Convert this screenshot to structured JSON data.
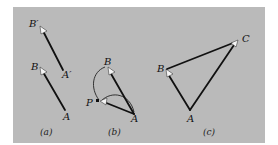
{
  "figure": {
    "background_color": "#bababa",
    "panels": [
      {
        "id": "a",
        "caption": "(a)",
        "points": {
          "B_prime": {
            "label": "B′",
            "x": 41,
            "y": 28
          },
          "A_prime": {
            "label": "A′",
            "x": 63,
            "y": 70
          },
          "B": {
            "label": "B",
            "x": 41,
            "y": 69
          },
          "A": {
            "label": "A",
            "x": 65,
            "y": 110
          }
        },
        "vectors": [
          {
            "from": "A_prime",
            "to": "B_prime"
          },
          {
            "from": "A",
            "to": "B"
          }
        ]
      },
      {
        "id": "b",
        "caption": "(b)",
        "points": {
          "B": {
            "label": "B",
            "x": 108,
            "y": 68
          },
          "P": {
            "label": "P",
            "x": 101,
            "y": 101
          },
          "A": {
            "label": "A",
            "x": 134,
            "y": 114
          }
        },
        "vectors": [
          {
            "from": "A",
            "to": "B"
          },
          {
            "from": "A",
            "to": "P"
          }
        ],
        "paths": [
          {
            "from": "P",
            "to": "B",
            "style": "curved-thin"
          },
          {
            "from": "P",
            "to": "A",
            "style": "curved-thin"
          }
        ]
      },
      {
        "id": "c",
        "caption": "(c)",
        "points": {
          "A": {
            "label": "A",
            "x": 190,
            "y": 110
          },
          "B": {
            "label": "B",
            "x": 166,
            "y": 70
          },
          "C": {
            "label": "C",
            "x": 237,
            "y": 41
          }
        },
        "vectors": [
          {
            "from": "A",
            "to": "B"
          },
          {
            "from": "B",
            "to": "C"
          },
          {
            "from": "A",
            "to": "C"
          }
        ]
      }
    ]
  }
}
